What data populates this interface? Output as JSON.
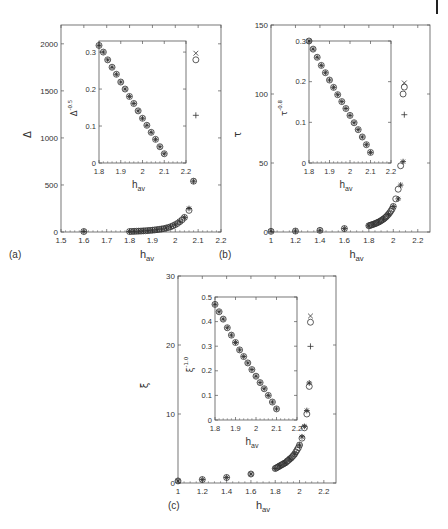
{
  "figure": {
    "caption_text": ""
  },
  "chart_data": [
    {
      "panel_label": "(a)",
      "type": "scatter",
      "xlabel": "h_av",
      "ylabel": "Δ",
      "xlim": [
        1.5,
        2.2
      ],
      "ylim": [
        0,
        2200
      ],
      "xticks": [
        1.5,
        1.6,
        1.7,
        1.8,
        1.9,
        2,
        2.1,
        2.2
      ],
      "xtick_labels": [
        "1.5",
        "1.6",
        "1.7",
        "1.8",
        "1.9",
        "2",
        "2.1",
        "2.2"
      ],
      "yticks": [
        0,
        500,
        1000,
        1500,
        2000
      ],
      "ytick_labels": [
        "0",
        "500",
        "1000",
        "1500",
        "2000"
      ],
      "grid": false,
      "box": {
        "x": 61,
        "y": 25,
        "w": 160,
        "h": 207
      },
      "series": [
        {
          "name": "circle",
          "marker": "o",
          "x": [
            1.6,
            1.8,
            1.81,
            1.82,
            1.83,
            1.84,
            1.85,
            1.86,
            1.87,
            1.88,
            1.89,
            1.9,
            1.91,
            1.92,
            1.93,
            1.94,
            1.95,
            1.96,
            1.97,
            1.98,
            1.99,
            2.0,
            2.01,
            2.02,
            2.03,
            2.04,
            2.06,
            2.08,
            2.09
          ],
          "y": [
            5,
            5,
            6,
            7,
            8,
            9,
            10,
            12,
            13,
            15,
            17,
            19,
            22,
            25,
            28,
            32,
            36,
            42,
            48,
            56,
            66,
            78,
            92,
            110,
            130,
            155,
            230,
            540,
            1830
          ]
        },
        {
          "name": "star",
          "marker": "*",
          "x": [
            1.6,
            1.8,
            1.82,
            1.84,
            1.86,
            1.88,
            1.9,
            1.92,
            1.94,
            1.96,
            1.98,
            2.0,
            2.02,
            2.04,
            2.06,
            2.08
          ],
          "y": [
            5,
            5,
            7,
            9,
            12,
            15,
            19,
            25,
            32,
            42,
            56,
            78,
            110,
            155,
            250,
            540
          ]
        },
        {
          "name": "cross",
          "marker": "x",
          "x": [
            2.09
          ],
          "y": [
            1900
          ]
        },
        {
          "name": "plus",
          "marker": "+",
          "x": [
            2.09
          ],
          "y": [
            1240
          ]
        }
      ],
      "inset": {
        "xlabel": "h_av",
        "ylabel": "Δ^-0.5",
        "ylabel_base": "Δ",
        "ylabel_exp": "-0.5",
        "xlim": [
          1.8,
          2.2
        ],
        "ylim": [
          0,
          0.33
        ],
        "xticks": [
          1.8,
          1.9,
          2,
          2.1,
          2.2
        ],
        "xtick_labels": [
          "1.8",
          "1.9",
          "2",
          "2.1",
          "2.2"
        ],
        "yticks": [
          0,
          0.1,
          0.2,
          0.3
        ],
        "ytick_labels": [
          "0",
          "0.1",
          "0.2",
          "0.3"
        ],
        "box": {
          "x": 99,
          "y": 41,
          "w": 87,
          "h": 122
        },
        "x": [
          1.8,
          1.82,
          1.84,
          1.86,
          1.88,
          1.9,
          1.92,
          1.94,
          1.96,
          1.98,
          2.0,
          2.02,
          2.04,
          2.06,
          2.08,
          2.1
        ],
        "y": [
          0.318,
          0.3,
          0.279,
          0.259,
          0.24,
          0.219,
          0.2,
          0.18,
          0.161,
          0.141,
          0.121,
          0.102,
          0.083,
          0.064,
          0.044,
          0.025
        ]
      }
    },
    {
      "panel_label": "(b)",
      "type": "scatter",
      "xlabel": "h_av",
      "ylabel": "τ",
      "xlim": [
        1.0,
        2.3
      ],
      "ylim": [
        0,
        150
      ],
      "xticks": [
        1,
        1.2,
        1.4,
        1.6,
        1.8,
        2,
        2.2
      ],
      "xtick_labels": [
        "1",
        "1.2",
        "1.4",
        "1.6",
        "1.8",
        "2",
        "2.2"
      ],
      "yticks": [
        0,
        50,
        100,
        150
      ],
      "ytick_labels": [
        "0",
        "50",
        "100",
        "150"
      ],
      "grid": false,
      "box": {
        "x": 271,
        "y": 25,
        "w": 159,
        "h": 207
      },
      "series": [
        {
          "name": "circle",
          "marker": "o",
          "x": [
            1.0,
            1.2,
            1.4,
            1.6,
            1.8,
            1.81,
            1.82,
            1.83,
            1.84,
            1.85,
            1.86,
            1.87,
            1.88,
            1.89,
            1.9,
            1.91,
            1.92,
            1.93,
            1.94,
            1.95,
            1.96,
            1.97,
            1.98,
            1.99,
            2.0,
            2.02,
            2.04,
            2.06,
            2.08,
            2.09
          ],
          "y": [
            0.5,
            0.7,
            1.2,
            2.5,
            4.5,
            4.8,
            5.1,
            5.4,
            5.7,
            6.0,
            6.4,
            6.8,
            7.2,
            7.7,
            8.2,
            8.8,
            9.4,
            10.1,
            10.9,
            11.8,
            12.8,
            13.9,
            15.2,
            16.6,
            18.5,
            24,
            31,
            48,
            100,
            105
          ]
        },
        {
          "name": "star",
          "marker": "*",
          "x": [
            1.0,
            1.2,
            1.4,
            1.6,
            1.8,
            1.84,
            1.88,
            1.92,
            1.96,
            2.0,
            2.04,
            2.06,
            2.08
          ],
          "y": [
            0.5,
            0.7,
            1.2,
            2.5,
            4.5,
            5.7,
            7.2,
            9.4,
            12.8,
            18.5,
            24,
            34,
            51
          ]
        },
        {
          "name": "cross",
          "marker": "x",
          "x": [
            2.09
          ],
          "y": [
            108
          ]
        },
        {
          "name": "plus",
          "marker": "+",
          "x": [
            2.09
          ],
          "y": [
            85
          ]
        }
      ],
      "inset": {
        "xlabel": "h_av",
        "ylabel": "τ^-0.8",
        "ylabel_base": "τ",
        "ylabel_exp": "-0.8",
        "xlim": [
          1.8,
          2.2
        ],
        "ylim": [
          0,
          0.3
        ],
        "xticks": [
          1.8,
          1.9,
          2,
          2.1,
          2.2
        ],
        "xtick_labels": [
          "1.8",
          "1.9",
          "2",
          "2.1",
          "2.2"
        ],
        "yticks": [
          0,
          0.1,
          0.2,
          0.3
        ],
        "ytick_labels": [
          "0",
          "0.1",
          "0.2",
          "0.3"
        ],
        "box": {
          "x": 309,
          "y": 41,
          "w": 82,
          "h": 122
        },
        "x": [
          1.8,
          1.82,
          1.84,
          1.86,
          1.88,
          1.9,
          1.92,
          1.94,
          1.96,
          1.98,
          2.0,
          2.02,
          2.04,
          2.06,
          2.08,
          2.1
        ],
        "y": [
          0.3,
          0.28,
          0.26,
          0.24,
          0.222,
          0.204,
          0.186,
          0.168,
          0.151,
          0.134,
          0.117,
          0.099,
          0.082,
          0.064,
          0.045,
          0.026
        ]
      }
    },
    {
      "panel_label": "(c)",
      "type": "scatter",
      "xlabel": "h_av",
      "ylabel": "ξ",
      "xlim": [
        1.0,
        2.3
      ],
      "ylim": [
        0,
        30
      ],
      "xticks": [
        1,
        1.2,
        1.4,
        1.6,
        1.8,
        2,
        2.2
      ],
      "xtick_labels": [
        "1",
        "1.2",
        "1.4",
        "1.6",
        "1.8",
        "2",
        "2.2"
      ],
      "yticks": [
        0,
        10,
        20,
        30
      ],
      "ytick_labels": [
        "0",
        "10",
        "20",
        "30"
      ],
      "grid": false,
      "box": {
        "x": 178,
        "y": 276,
        "w": 158,
        "h": 207
      },
      "series": [
        {
          "name": "circle",
          "marker": "o",
          "x": [
            1.0,
            1.2,
            1.4,
            1.6,
            1.8,
            1.81,
            1.82,
            1.83,
            1.84,
            1.85,
            1.86,
            1.87,
            1.88,
            1.89,
            1.9,
            1.91,
            1.92,
            1.93,
            1.94,
            1.95,
            1.96,
            1.97,
            1.98,
            1.99,
            2.0,
            2.02,
            2.04,
            2.06,
            2.08,
            2.09
          ],
          "y": [
            0.3,
            0.5,
            0.8,
            1.3,
            2.1,
            2.2,
            2.3,
            2.4,
            2.5,
            2.6,
            2.7,
            2.8,
            2.9,
            3.0,
            3.2,
            3.3,
            3.5,
            3.6,
            3.8,
            4.0,
            4.2,
            4.5,
            4.8,
            5.1,
            5.5,
            6.5,
            8.0,
            10.0,
            14.0,
            23.3
          ]
        },
        {
          "name": "star",
          "marker": "*",
          "x": [
            1.0,
            1.2,
            1.4,
            1.6,
            1.8,
            1.84,
            1.88,
            1.92,
            1.96,
            2.0,
            2.02,
            2.04,
            2.06,
            2.08
          ],
          "y": [
            0.3,
            0.5,
            0.8,
            1.3,
            2.1,
            2.5,
            2.9,
            3.5,
            4.2,
            5.5,
            6.7,
            8.2,
            10.5,
            14.5
          ]
        },
        {
          "name": "cross",
          "marker": "x",
          "x": [
            2.09
          ],
          "y": [
            24.2
          ]
        },
        {
          "name": "plus",
          "marker": "+",
          "x": [
            2.09
          ],
          "y": [
            19.8
          ]
        }
      ],
      "inset": {
        "xlabel": "h_av",
        "ylabel": "ξ^-1.0",
        "ylabel_base": "ξ",
        "ylabel_exp": "-1.0",
        "xlim": [
          1.8,
          2.2
        ],
        "ylim": [
          0,
          0.5
        ],
        "xticks": [
          1.8,
          1.9,
          2,
          2.1,
          2.2
        ],
        "xtick_labels": [
          "1.8",
          "1.9",
          "2",
          "2.1",
          "2.2"
        ],
        "yticks": [
          0,
          0.1,
          0.2,
          0.3,
          0.4,
          0.5
        ],
        "ytick_labels": [
          "0",
          "0.1",
          "0.2",
          "0.3",
          "0.4",
          "0.5"
        ],
        "box": {
          "x": 215,
          "y": 297,
          "w": 82,
          "h": 123
        },
        "x": [
          1.8,
          1.82,
          1.84,
          1.86,
          1.88,
          1.9,
          1.92,
          1.94,
          1.96,
          1.98,
          2.0,
          2.02,
          2.04,
          2.06,
          2.08,
          2.1
        ],
        "y": [
          0.47,
          0.44,
          0.41,
          0.375,
          0.345,
          0.315,
          0.285,
          0.258,
          0.232,
          0.205,
          0.178,
          0.152,
          0.127,
          0.1,
          0.073,
          0.045
        ]
      }
    }
  ]
}
